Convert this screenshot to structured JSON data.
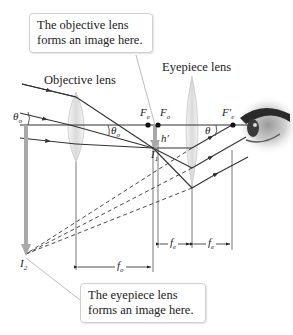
{
  "diagram": {
    "callouts": {
      "objective": "The objective lens forms an image here.",
      "eyepiece": "The eyepiece lens forms an image here."
    },
    "labels": {
      "objective_lens": "Objective lens",
      "eyepiece_lens": "Eyepiece lens"
    },
    "symbols": {
      "theta_o_left": "θ",
      "theta_o_left_sub": "o",
      "theta_o_mid": "θ",
      "theta_o_mid_sub": "o",
      "theta": "θ",
      "F_e": "F",
      "F_e_sub": "e",
      "F_o": "F",
      "F_o_sub": "o",
      "F_e_prime": "F′",
      "F_e_prime_sub": "e",
      "h_prime": "h′",
      "I1": "I",
      "I1_sub": "1",
      "I2": "I",
      "I2_sub": "2",
      "f_o": "f",
      "f_o_sub": "o",
      "f_e1": "f",
      "f_e1_sub": "e",
      "f_e2": "f",
      "f_e2_sub": "e"
    },
    "colors": {
      "ray": "#3a3a3a",
      "axis": "#333333",
      "lens_fill": "#e6e6e6",
      "image_arrow": "#a8a8a8",
      "callout_border": "#cfcfcf"
    }
  }
}
